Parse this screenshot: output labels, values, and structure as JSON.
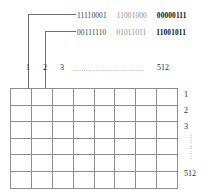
{
  "figure": {
    "annotations": [
      {
        "groups": [
          {
            "text": "11110001",
            "style": "normal"
          },
          {
            "text": "11001000",
            "style": "light"
          },
          {
            "text": "00000111",
            "style": "bold"
          }
        ]
      },
      {
        "groups": [
          {
            "text": "00111110",
            "style": "normal"
          },
          {
            "text": "01011011",
            "style": "light"
          },
          {
            "text": "11001011",
            "style": "bold"
          }
        ]
      }
    ],
    "column_labels": [
      "1",
      "2",
      "3",
      "512"
    ],
    "column_ellipsis": "...............................",
    "row_labels": [
      "1",
      "2",
      "3",
      "512"
    ],
    "row_ellipsis": ":\n:\n:\n:\n:",
    "grid": {
      "columns": 8,
      "rows": 6,
      "cells": [
        [
          "",
          "",
          "",
          "",
          "",
          "",
          "",
          ""
        ],
        [
          "",
          "",
          "",
          "",
          "",
          "",
          "",
          ""
        ],
        [
          "",
          "",
          "",
          "",
          "",
          "",
          "",
          ""
        ],
        [
          "",
          "",
          "",
          "",
          "",
          "",
          "",
          ""
        ],
        [
          "",
          "",
          "",
          "",
          "",
          "",
          "",
          ""
        ],
        [
          "",
          "",
          "",
          "",
          "",
          "",
          "",
          ""
        ]
      ]
    },
    "colors": {
      "line": "#6f6f6f",
      "grid_border": "#8d8d8d",
      "text": "#2a2a2a",
      "muted_text": "#8a8a8a",
      "bold_text": "#111111",
      "background": "#ffffff"
    }
  }
}
